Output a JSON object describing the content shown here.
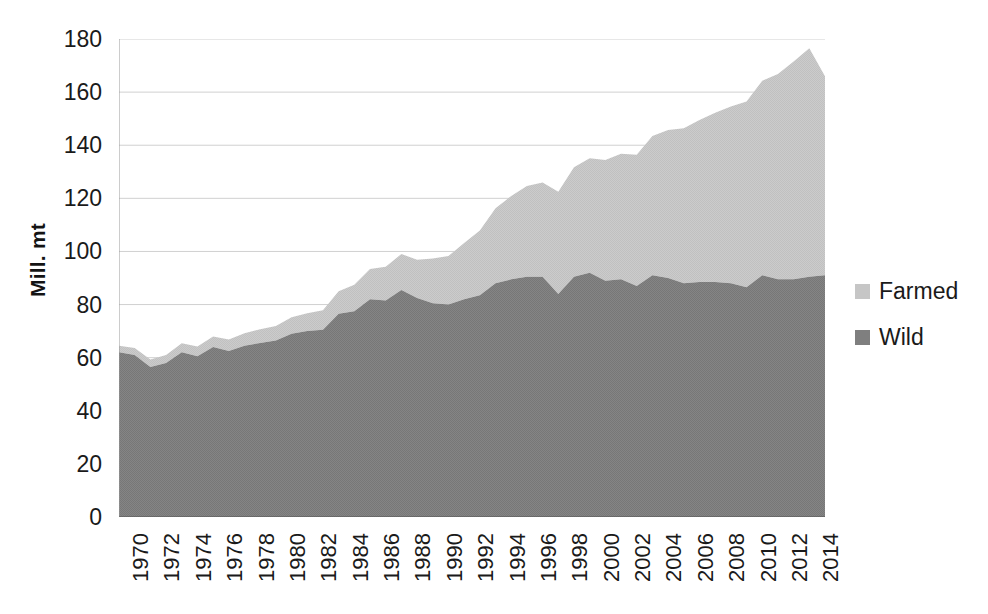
{
  "chart_data": {
    "type": "area",
    "stacked": true,
    "title": "",
    "xlabel": "",
    "ylabel": "Mill. mt",
    "ylim": [
      0,
      180
    ],
    "ytick_step": 20,
    "yticks": [
      0,
      20,
      40,
      60,
      80,
      100,
      120,
      140,
      160,
      180
    ],
    "xlim": [
      1970,
      2015
    ],
    "grid": true,
    "grid_axis": "y",
    "legend_position": "right",
    "x": [
      1970,
      1971,
      1972,
      1973,
      1974,
      1975,
      1976,
      1977,
      1978,
      1979,
      1980,
      1981,
      1982,
      1983,
      1984,
      1985,
      1986,
      1987,
      1988,
      1989,
      1990,
      1991,
      1992,
      1993,
      1994,
      1995,
      1996,
      1997,
      1998,
      1999,
      2000,
      2001,
      2002,
      2003,
      2004,
      2005,
      2006,
      2007,
      2008,
      2009,
      2010,
      2011,
      2012,
      2013,
      2014,
      2015
    ],
    "xtick_labels": [
      "1970",
      "1972",
      "1974",
      "1976",
      "1978",
      "1980",
      "1982",
      "1984",
      "1986",
      "1988",
      "1990",
      "1992",
      "1994",
      "1996",
      "1998",
      "2000",
      "2002",
      "2004",
      "2006",
      "2008",
      "2010",
      "2012",
      "2014"
    ],
    "series": [
      {
        "name": "Wild",
        "color": "#7f7f7f",
        "stack_order": 0,
        "values": [
          62.0,
          61.0,
          56.5,
          58.0,
          62.0,
          60.5,
          64.0,
          62.5,
          64.5,
          65.5,
          66.5,
          69.0,
          70.0,
          70.5,
          76.5,
          77.5,
          82.0,
          81.5,
          85.5,
          82.5,
          80.5,
          80.0,
          82.0,
          83.5,
          88.0,
          89.5,
          90.5,
          90.5,
          84.0,
          90.5,
          92.0,
          89.0,
          89.5,
          87.0,
          91.0,
          90.0,
          88.0,
          88.5,
          88.5,
          88.0,
          86.5,
          91.0,
          89.5,
          89.5,
          90.5,
          91.0
        ]
      },
      {
        "name": "Farmed",
        "color": "#c6c6c6",
        "stack_order": 1,
        "values": [
          2.5,
          2.6,
          2.8,
          3.0,
          3.4,
          3.7,
          4.0,
          4.3,
          4.7,
          5.2,
          5.4,
          6.2,
          6.7,
          7.4,
          8.5,
          10.0,
          11.4,
          12.7,
          13.5,
          14.4,
          16.8,
          18.3,
          21.2,
          24.4,
          28.3,
          31.4,
          34.1,
          35.5,
          38.5,
          41.2,
          43.1,
          45.4,
          47.3,
          49.4,
          52.5,
          55.7,
          58.4,
          61.0,
          63.7,
          66.6,
          70.0,
          73.3,
          77.3,
          82.0,
          86.0,
          75.0
        ]
      }
    ],
    "total_values": [
      64.5,
      63.6,
      59.3,
      61.0,
      65.4,
      64.2,
      68.0,
      66.8,
      69.2,
      70.7,
      71.9,
      75.2,
      76.7,
      77.9,
      85.0,
      87.5,
      93.4,
      94.2,
      99.0,
      96.9,
      97.3,
      98.3,
      103.2,
      107.9,
      116.3,
      120.9,
      124.6,
      126.0,
      122.5,
      131.7,
      135.1,
      134.4,
      136.8,
      136.4,
      143.5,
      145.7,
      146.4,
      149.5,
      152.2,
      154.6,
      156.5,
      164.3,
      166.8,
      171.5,
      176.5,
      166.0
    ]
  },
  "axis": {
    "y_title": "Mill. mt"
  },
  "legend": {
    "entries": [
      {
        "label": "Farmed",
        "color": "#c6c6c6"
      },
      {
        "label": "Wild",
        "color": "#7f7f7f"
      }
    ]
  }
}
